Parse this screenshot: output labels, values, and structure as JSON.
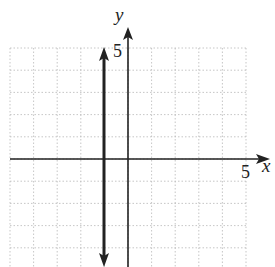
{
  "chart_data": {
    "type": "line",
    "title": "",
    "xlabel": "x",
    "ylabel": "y",
    "x_tick_label": "5",
    "y_tick_label": "5",
    "xlim": [
      -5,
      5
    ],
    "ylim": [
      -4,
      5
    ],
    "grid": true,
    "series": [
      {
        "name": "x = -1",
        "equation": "x = -1",
        "x": [
          -1,
          -1
        ],
        "y": [
          -4,
          5
        ]
      }
    ]
  },
  "labels": {
    "x_axis": "x",
    "y_axis": "y",
    "x_tick": "5",
    "y_tick": "5"
  }
}
